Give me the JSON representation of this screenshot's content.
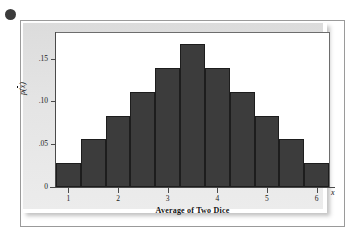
{
  "figure": {
    "bullet_marker": "bullet-dot",
    "background_color": "#e6e6e6",
    "bar_color": "#3c3c3c",
    "frame_color": "#6d6d6d"
  },
  "chart_data": {
    "type": "bar",
    "title": "",
    "subtitle": "",
    "xlabel": "Average of Two Dice",
    "ylabel": "p(x̄)",
    "x_axis_symbol": "x̄",
    "categories": [
      "1",
      "1.5",
      "2",
      "2.5",
      "3",
      "3.5",
      "4",
      "4.5",
      "5",
      "5.5",
      "6"
    ],
    "x": [
      1,
      1.5,
      2,
      2.5,
      3,
      3.5,
      4,
      4.5,
      5,
      5.5,
      6
    ],
    "values": [
      0.0278,
      0.0556,
      0.0833,
      0.1111,
      0.1389,
      0.1667,
      0.1389,
      0.1111,
      0.0833,
      0.0556,
      0.0278
    ],
    "value_fractions": [
      "1/36",
      "2/36",
      "3/36",
      "4/36",
      "5/36",
      "6/36",
      "5/36",
      "4/36",
      "3/36",
      "2/36",
      "1/36"
    ],
    "xlim": [
      0.75,
      6.25
    ],
    "ylim": [
      0,
      0.18
    ],
    "xticks": [
      1,
      2,
      3,
      4,
      5,
      6
    ],
    "xtick_labels": [
      "1",
      "2",
      "3",
      "4",
      "5",
      "6"
    ],
    "yticks": [
      0,
      0.05,
      0.1,
      0.15
    ],
    "ytick_labels": [
      "0",
      ".05",
      ".10",
      ".15"
    ],
    "grid": false,
    "legend": null,
    "bar_width": 0.5,
    "annotations": []
  }
}
